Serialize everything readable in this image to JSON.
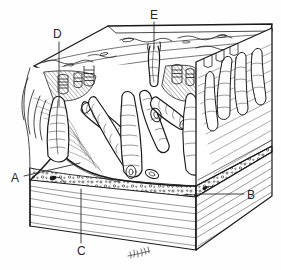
{
  "figure": {
    "style": "pen-and-ink line drawing",
    "width_px": 281,
    "height_px": 270,
    "background_color": "#fefefe",
    "ink_color": "#1a1a1a",
    "signature": "artist initials"
  },
  "labels": [
    {
      "id": "A",
      "text": "A",
      "x": 11,
      "y": 172,
      "leader": {
        "x1": 24,
        "y1": 176,
        "x2": 80,
        "y2": 163
      }
    },
    {
      "id": "B",
      "text": "B",
      "x": 247,
      "y": 189,
      "leader": {
        "x1": 244,
        "y1": 194,
        "x2": 196,
        "y2": 194
      }
    },
    {
      "id": "C",
      "text": "C",
      "x": 77,
      "y": 245,
      "leader": {
        "x1": 81,
        "y1": 243,
        "x2": 81,
        "y2": 189
      }
    },
    {
      "id": "D",
      "text": "D",
      "x": 53,
      "y": 28,
      "leader": {
        "x1": 59,
        "y1": 42,
        "x2": 59,
        "y2": 106
      }
    },
    {
      "id": "E",
      "text": "E",
      "x": 150,
      "y": 9,
      "leader": {
        "x1": 154,
        "y1": 22,
        "x2": 154,
        "y2": 49
      }
    }
  ],
  "structures": {
    "surface": "luminal mucosal surface",
    "villi": "finger-like villi projecting into lumen",
    "crypt": "crypt invagination",
    "muscularis_mucosae": "thin muscular band under mucosa",
    "submucosa": "stippled submucosal layer with vessels",
    "base_layer": "muscular wall base with hatch shading"
  }
}
